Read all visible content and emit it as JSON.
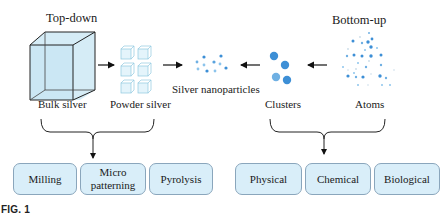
{
  "figure": {
    "caption_label": "FIG. 1",
    "approaches": {
      "top_down": {
        "title": "Top-down",
        "stages": [
          {
            "label": "Bulk silver",
            "icon": "large-cube-icon"
          },
          {
            "label": "Powder silver",
            "icon": "small-cubes-grid-icon"
          }
        ],
        "methods": [
          "Milling",
          "Micro\npatterning",
          "Pyrolysis"
        ]
      },
      "bottom_up": {
        "title": "Bottom-up",
        "stages": [
          {
            "label": "Atoms",
            "icon": "scattered-dots-icon"
          },
          {
            "label": "Clusters",
            "icon": "cluster-circles-icon"
          }
        ],
        "methods": [
          "Physical",
          "Chemical",
          "Biological"
        ]
      }
    },
    "product": {
      "label": "Silver nanoparticles",
      "icon": "nanoparticle-dots-icon"
    },
    "colors": {
      "box_fill": "#d9eef9",
      "box_border": "#8aa6bc",
      "cube_fill": "#cfeaf5",
      "particle_blue": "#3d8fd6",
      "particle_light": "#8cc4ec",
      "arrow": "#111111"
    }
  }
}
